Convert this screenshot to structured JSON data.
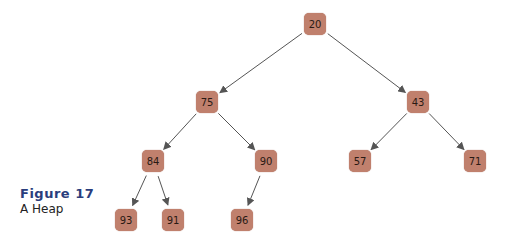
{
  "figure": {
    "label": "Figure 17",
    "caption": "A Heap"
  },
  "colors": {
    "node_fill": "#c0806d",
    "edge": "#555555",
    "title": "#2a3d7c"
  },
  "tree": {
    "nodes": [
      {
        "id": "n20",
        "value": "20",
        "x": 315,
        "y": 24
      },
      {
        "id": "n75",
        "value": "75",
        "x": 207,
        "y": 102
      },
      {
        "id": "n43",
        "value": "43",
        "x": 418,
        "y": 102
      },
      {
        "id": "n84",
        "value": "84",
        "x": 153,
        "y": 161
      },
      {
        "id": "n90",
        "value": "90",
        "x": 266,
        "y": 161
      },
      {
        "id": "n57",
        "value": "57",
        "x": 360,
        "y": 161
      },
      {
        "id": "n71",
        "value": "71",
        "x": 475,
        "y": 161
      },
      {
        "id": "n93",
        "value": "93",
        "x": 126,
        "y": 220
      },
      {
        "id": "n91",
        "value": "91",
        "x": 173,
        "y": 220
      },
      {
        "id": "n96",
        "value": "96",
        "x": 242,
        "y": 220
      }
    ],
    "edges": [
      [
        "n20",
        "n75"
      ],
      [
        "n20",
        "n43"
      ],
      [
        "n75",
        "n84"
      ],
      [
        "n75",
        "n90"
      ],
      [
        "n43",
        "n57"
      ],
      [
        "n43",
        "n71"
      ],
      [
        "n84",
        "n93"
      ],
      [
        "n84",
        "n91"
      ],
      [
        "n90",
        "n96"
      ]
    ]
  }
}
